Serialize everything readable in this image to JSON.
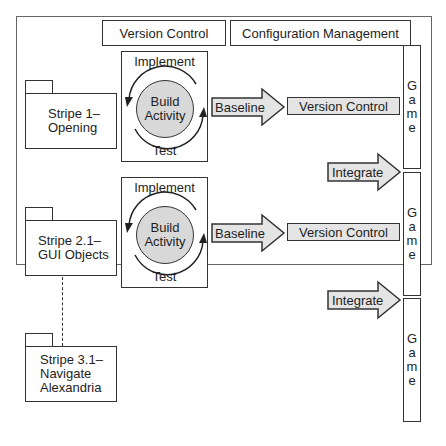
{
  "headers": {
    "version_control": "Version Control",
    "configuration_management": "Configuration Management"
  },
  "stripes": [
    {
      "line1": "Stripe 1–",
      "line2": "Opening"
    },
    {
      "line1": "Stripe 2.1–",
      "line2": "GUI Objects"
    },
    {
      "line1": "Stripe 3.1–",
      "line2": "Navigate",
      "line3": "Alexandria"
    }
  ],
  "build_cycles": [
    {
      "top": "Implement",
      "center1": "Build",
      "center2": "Activity",
      "bottom": "Test"
    },
    {
      "top": "Implement",
      "center1": "Build",
      "center2": "Activity",
      "bottom": "Test"
    }
  ],
  "baselines": [
    {
      "arrow": "Baseline",
      "target": "Version Control"
    },
    {
      "arrow": "Baseline",
      "target": "Version Control"
    }
  ],
  "integrates": [
    "Integrate",
    "Integrate"
  ],
  "games": [
    {
      "letters": [
        "G",
        "a",
        "m",
        "e"
      ]
    },
    {
      "letters": [
        "G",
        "a",
        "m",
        "e"
      ]
    },
    {
      "letters": [
        "G",
        "a",
        "m",
        "e"
      ]
    }
  ],
  "colors": {
    "stroke": "#333333",
    "fill_grey": "#d8d8d8",
    "arrow_fill": "#e4e4e4"
  }
}
